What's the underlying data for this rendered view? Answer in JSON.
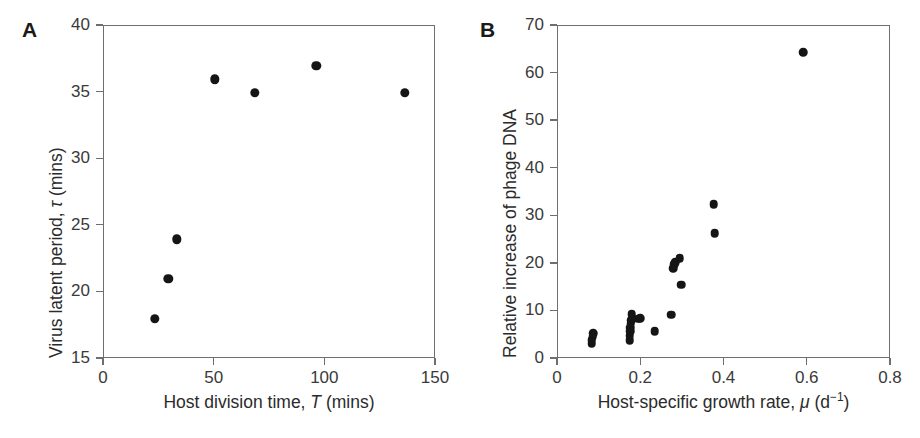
{
  "figure": {
    "background": "#ffffff",
    "marker_color": "#151515",
    "axis_color": "#6f6f6f",
    "text_color": "#2b2b2b"
  },
  "panels": [
    {
      "letter": "A",
      "axis_title_x_parts": [
        "Host division time, ",
        "T",
        " (mins)"
      ],
      "axis_title_y_parts": [
        "Virus latent period, ",
        "τ",
        " (mins)"
      ],
      "xticks": [
        "0",
        "50",
        "100",
        "150"
      ],
      "yticks": [
        "15",
        "20",
        "25",
        "30",
        "35",
        "40"
      ]
    },
    {
      "letter": "B",
      "axis_title_x_parts": [
        "Host-specific growth rate, ",
        "μ",
        " (d",
        "−1",
        ")"
      ],
      "axis_title_y_parts": [
        "Relative increase of phage DNA"
      ],
      "xticks": [
        "0",
        "0.2",
        "0.4",
        "0.6",
        "0.8"
      ],
      "yticks": [
        "0",
        "10",
        "20",
        "30",
        "40",
        "50",
        "60",
        "70"
      ]
    }
  ],
  "chart_data": [
    {
      "type": "scatter",
      "panel": "A",
      "title": "",
      "xlabel": "Host division time, T (mins)",
      "ylabel": "Virus latent period, τ (mins)",
      "xlim": [
        0,
        150
      ],
      "ylim": [
        15,
        40
      ],
      "xticks": [
        0,
        50,
        100,
        150
      ],
      "yticks": [
        15,
        20,
        25,
        30,
        35,
        40
      ],
      "grid": false,
      "legend": "none",
      "points": [
        {
          "x": 23,
          "y": 18
        },
        {
          "x": 29,
          "y": 21
        },
        {
          "x": 33,
          "y": 24
        },
        {
          "x": 50,
          "y": 36
        },
        {
          "x": 68,
          "y": 35
        },
        {
          "x": 96,
          "y": 37
        },
        {
          "x": 136,
          "y": 35
        }
      ]
    },
    {
      "type": "scatter",
      "panel": "B",
      "title": "",
      "xlabel": "Host-specific growth rate, μ (d−1)",
      "ylabel": "Relative increase of phage DNA",
      "xlim": [
        0,
        0.8
      ],
      "ylim": [
        0,
        70
      ],
      "xticks": [
        0,
        0.2,
        0.4,
        0.6,
        0.8
      ],
      "yticks": [
        0,
        10,
        20,
        30,
        40,
        50,
        60,
        70
      ],
      "grid": false,
      "legend": "none",
      "points": [
        {
          "x": 0.081,
          "y": 3.2
        },
        {
          "x": 0.081,
          "y": 4.0
        },
        {
          "x": 0.083,
          "y": 4.7
        },
        {
          "x": 0.084,
          "y": 5.4
        },
        {
          "x": 0.172,
          "y": 4.0
        },
        {
          "x": 0.172,
          "y": 4.9
        },
        {
          "x": 0.173,
          "y": 5.8
        },
        {
          "x": 0.174,
          "y": 6.6
        },
        {
          "x": 0.175,
          "y": 7.4
        },
        {
          "x": 0.176,
          "y": 8.2
        },
        {
          "x": 0.177,
          "y": 9.4
        },
        {
          "x": 0.193,
          "y": 8.5
        },
        {
          "x": 0.198,
          "y": 8.6
        },
        {
          "x": 0.232,
          "y": 5.9
        },
        {
          "x": 0.272,
          "y": 9.3
        },
        {
          "x": 0.277,
          "y": 19.1
        },
        {
          "x": 0.279,
          "y": 19.9
        },
        {
          "x": 0.281,
          "y": 20.4
        },
        {
          "x": 0.292,
          "y": 21.2
        },
        {
          "x": 0.296,
          "y": 15.6
        },
        {
          "x": 0.374,
          "y": 32.5
        },
        {
          "x": 0.376,
          "y": 26.4
        },
        {
          "x": 0.589,
          "y": 64.5
        }
      ]
    }
  ]
}
